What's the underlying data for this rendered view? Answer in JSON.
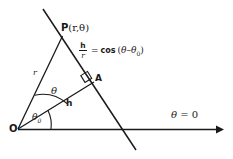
{
  "diagram": {
    "background_color": "#ffffff",
    "stroke_color": "#1a1a1a",
    "labels": {
      "point_P": "P",
      "point_P_coords": "(r,θ)",
      "origin": "O",
      "foot_A": "A",
      "radius": "r",
      "perpendicular": "h",
      "angle_theta": "θ",
      "angle_theta0": "θ",
      "angle_theta0_sub": "0",
      "axis_label": "θ = 0",
      "axis_label_theta": "θ",
      "axis_label_eq": "= 0"
    },
    "equation": {
      "numerator": "h",
      "denominator": "r",
      "equals": "=",
      "function": "cos",
      "arg_open": "(",
      "arg_theta": "θ",
      "arg_minus": "–",
      "arg_theta0": "θ",
      "arg_theta0_sub": "0",
      "arg_close": ")",
      "full_text": "h/r = cos (θ – θ₀)"
    },
    "geometry": {
      "origin": [
        18,
        129
      ],
      "point_P": [
        62,
        36
      ],
      "point_A": [
        93,
        83
      ],
      "axis_start": [
        18,
        129
      ],
      "axis_end": [
        223,
        129
      ],
      "line_start": [
        43,
        9
      ],
      "line_end": [
        136,
        150
      ],
      "right_angle_marker": true
    }
  }
}
